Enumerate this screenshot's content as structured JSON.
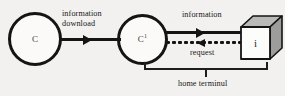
{
  "diagram": {
    "background_color": "#f2f1ef",
    "stroke_color": "#141414",
    "nodes": [
      {
        "id": "c",
        "icon": "circle-node-icon",
        "label": "C",
        "superscript": ""
      },
      {
        "id": "c1",
        "icon": "circle-node-icon",
        "label": "C",
        "superscript": "1"
      },
      {
        "id": "terminal",
        "icon": "cube-icon",
        "label": "i",
        "top_face_color": "#b8b8b6",
        "side_face_color": "#9e9e9c",
        "front_face_color": "#fcfcfa"
      }
    ],
    "edges": [
      {
        "id": "information-download",
        "label_line_1": "information",
        "label_line_2": "download",
        "style": "solid",
        "direction": "right"
      },
      {
        "id": "information",
        "label": "information",
        "style": "solid",
        "direction": "right"
      },
      {
        "id": "request",
        "label": "request",
        "style": "dotted",
        "direction": "left"
      }
    ],
    "bracket": {
      "label": "home terminul"
    }
  }
}
